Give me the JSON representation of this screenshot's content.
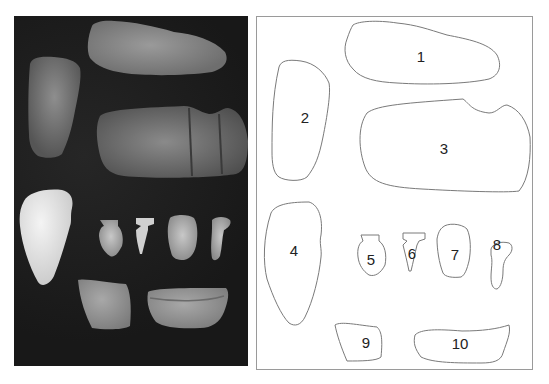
{
  "figure": {
    "left_panel": "photograph of ten stone artifacts on dark background",
    "right_panel": "outline drawing with numbered artifacts",
    "labels": [
      {
        "id": 1,
        "text": "1",
        "x": 164,
        "y": 39
      },
      {
        "id": 2,
        "text": "2",
        "x": 48,
        "y": 100
      },
      {
        "id": 3,
        "text": "3",
        "x": 187,
        "y": 131
      },
      {
        "id": 4,
        "text": "4",
        "x": 37,
        "y": 233
      },
      {
        "id": 5,
        "text": "5",
        "x": 114,
        "y": 242
      },
      {
        "id": 6,
        "text": "6",
        "x": 155,
        "y": 236
      },
      {
        "id": 7,
        "text": "7",
        "x": 198,
        "y": 237
      },
      {
        "id": 8,
        "text": "8",
        "x": 240,
        "y": 227
      },
      {
        "id": 9,
        "text": "9",
        "x": 109,
        "y": 325
      },
      {
        "id": 10,
        "text": "10",
        "x": 203,
        "y": 326
      }
    ]
  },
  "colors": {
    "photo_bg": "#1b1b1b",
    "stone_light": "#d8d8d8",
    "stone_mid": "#8a8a8a",
    "outline": "#7a7a7a",
    "frame": "#9a9a9a"
  }
}
